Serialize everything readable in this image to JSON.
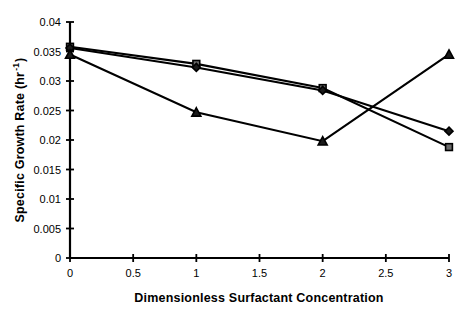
{
  "chart_data": {
    "type": "line",
    "title": "",
    "subtitle": "",
    "xlabel": "Dimensionless Surfactant Concentration",
    "ylabel": "Specific Growth Rate (hr",
    "ylabel_superscript": "-1",
    "ylabel_suffix": ")",
    "x": [
      0,
      1,
      2,
      3
    ],
    "xlim": [
      0,
      3
    ],
    "ylim": [
      0,
      0.04
    ],
    "xticks": [
      0,
      0.5,
      1,
      1.5,
      2,
      2.5,
      3
    ],
    "xticklabels": [
      "0",
      "0.5",
      "1",
      "1.5",
      "2",
      "2.5",
      "3"
    ],
    "yticks": [
      0,
      0.005,
      0.01,
      0.015,
      0.02,
      0.025,
      0.03,
      0.035,
      0.04
    ],
    "yticklabels": [
      "0",
      "0.005",
      "0.01",
      "0.015",
      "0.02",
      "0.025",
      "0.03",
      "0.035",
      "0.04"
    ],
    "grid": false,
    "legend": "none",
    "series": [
      {
        "name": "series-square",
        "marker": "square",
        "color": "#000000",
        "values": [
          0.0358,
          0.0329,
          0.0288,
          0.0188
        ]
      },
      {
        "name": "series-diamond",
        "marker": "diamond",
        "color": "#000000",
        "values": [
          0.0356,
          0.0323,
          0.0284,
          0.0215
        ]
      },
      {
        "name": "series-triangle",
        "marker": "triangle",
        "color": "#000000",
        "values": [
          0.0345,
          0.0247,
          0.0198,
          0.0345
        ]
      }
    ]
  },
  "axes": {
    "x_title": "Dimensionless Surfactant Concentration",
    "y_title_main": "Specific Growth Rate (hr",
    "y_title_sup": "-1",
    "y_title_end": ")"
  }
}
